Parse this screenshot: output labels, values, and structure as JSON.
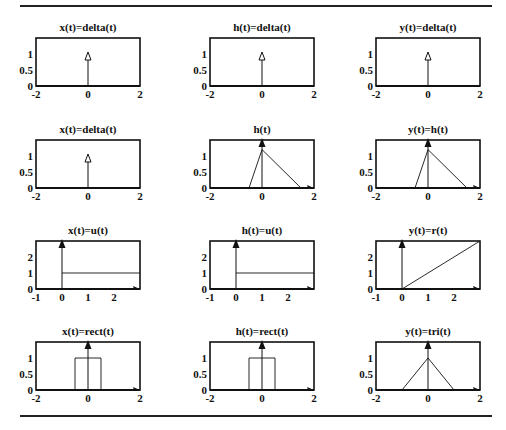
{
  "figure": {
    "rows": 4,
    "cols": 3,
    "panels": [
      {
        "title": "x(t)=delta(t)",
        "xlim": [
          -2,
          2
        ],
        "ylim": [
          0,
          1.5
        ],
        "xticks": [
          "-2",
          "0",
          "2"
        ],
        "yticks": [
          "0",
          "0.5",
          "1"
        ],
        "ytick_vals": [
          0,
          0.5,
          1
        ],
        "xtick_vals": [
          -2,
          0,
          2
        ],
        "kind": "impulse_open"
      },
      {
        "title": "h(t)=delta(t)",
        "xlim": [
          -2,
          2
        ],
        "ylim": [
          0,
          1.5
        ],
        "xticks": [
          "-2",
          "0",
          "2"
        ],
        "yticks": [
          "0",
          "0.5",
          "1"
        ],
        "ytick_vals": [
          0,
          0.5,
          1
        ],
        "xtick_vals": [
          -2,
          0,
          2
        ],
        "kind": "impulse_open"
      },
      {
        "title": "y(t)=delta(t)",
        "xlim": [
          -2,
          2
        ],
        "ylim": [
          0,
          1.5
        ],
        "xticks": [
          "-2",
          "0",
          "2"
        ],
        "yticks": [
          "0",
          "0.5",
          "1"
        ],
        "ytick_vals": [
          0,
          0.5,
          1
        ],
        "xtick_vals": [
          -2,
          0,
          2
        ],
        "kind": "impulse_open"
      },
      {
        "title": "x(t)=delta(t)",
        "xlim": [
          -2,
          2
        ],
        "ylim": [
          0,
          1.5
        ],
        "xticks": [
          "-2",
          "0",
          "2"
        ],
        "yticks": [
          "0",
          "0.5",
          "1"
        ],
        "ytick_vals": [
          0,
          0.5,
          1
        ],
        "xtick_vals": [
          -2,
          0,
          2
        ],
        "kind": "impulse_open"
      },
      {
        "title": "h(t)",
        "xlim": [
          -2,
          2
        ],
        "ylim": [
          0,
          1.5
        ],
        "xticks": [
          "-2",
          "0",
          "2"
        ],
        "yticks": [
          "0",
          "0.5",
          "1"
        ],
        "ytick_vals": [
          0,
          0.5,
          1
        ],
        "xtick_vals": [
          -2,
          0,
          2
        ],
        "kind": "curve",
        "points": [
          [
            -0.5,
            0
          ],
          [
            0,
            1.2
          ],
          [
            1.5,
            0
          ]
        ]
      },
      {
        "title": "y(t)=h(t)",
        "xlim": [
          -2,
          2
        ],
        "ylim": [
          0,
          1.5
        ],
        "xticks": [
          "-2",
          "0",
          "2"
        ],
        "yticks": [
          "0",
          "0.5",
          "1"
        ],
        "ytick_vals": [
          0,
          0.5,
          1
        ],
        "xtick_vals": [
          -2,
          0,
          2
        ],
        "kind": "curve",
        "points": [
          [
            -0.5,
            0
          ],
          [
            0,
            1.2
          ],
          [
            1.5,
            0
          ]
        ]
      },
      {
        "title": "x(t)=u(t)",
        "xlim": [
          -1,
          3
        ],
        "ylim": [
          0,
          3
        ],
        "xticks": [
          "-1",
          "0",
          "1",
          "2"
        ],
        "yticks": [
          "0",
          "1",
          "2"
        ],
        "ytick_vals": [
          0,
          1,
          2
        ],
        "xtick_vals": [
          -1,
          0,
          1,
          2
        ],
        "kind": "curve",
        "points": [
          [
            0,
            1
          ],
          [
            3,
            1
          ]
        ]
      },
      {
        "title": "h(t)=u(t)",
        "xlim": [
          -1,
          3
        ],
        "ylim": [
          0,
          3
        ],
        "xticks": [
          "-1",
          "0",
          "1",
          "2"
        ],
        "yticks": [
          "0",
          "1",
          "2"
        ],
        "ytick_vals": [
          0,
          1,
          2
        ],
        "xtick_vals": [
          -1,
          0,
          1,
          2
        ],
        "kind": "curve",
        "points": [
          [
            0,
            1
          ],
          [
            3,
            1
          ]
        ]
      },
      {
        "title": "y(t)=r(t)",
        "xlim": [
          -1,
          3
        ],
        "ylim": [
          0,
          3
        ],
        "xticks": [
          "-1",
          "0",
          "1",
          "2"
        ],
        "yticks": [
          "0",
          "1",
          "2"
        ],
        "ytick_vals": [
          0,
          1,
          2
        ],
        "xtick_vals": [
          -1,
          0,
          1,
          2
        ],
        "kind": "curve",
        "points": [
          [
            0,
            0
          ],
          [
            3,
            3
          ]
        ]
      },
      {
        "title": "x(t)=rect(t)",
        "xlim": [
          -2,
          2
        ],
        "ylim": [
          0,
          1.5
        ],
        "xticks": [
          "-2",
          "0",
          "2"
        ],
        "yticks": [
          "0",
          "0.5",
          "1"
        ],
        "ytick_vals": [
          0,
          0.5,
          1
        ],
        "xtick_vals": [
          -2,
          0,
          2
        ],
        "kind": "curve",
        "points": [
          [
            -0.5,
            0
          ],
          [
            -0.5,
            1
          ],
          [
            0.5,
            1
          ],
          [
            0.5,
            0
          ]
        ]
      },
      {
        "title": "h(t)=rect(t)",
        "xlim": [
          -2,
          2
        ],
        "ylim": [
          0,
          1.5
        ],
        "xticks": [
          "-2",
          "0",
          "2"
        ],
        "yticks": [
          "0",
          "0.5",
          "1"
        ],
        "ytick_vals": [
          0,
          0.5,
          1
        ],
        "xtick_vals": [
          -2,
          0,
          2
        ],
        "kind": "curve",
        "points": [
          [
            -0.5,
            0
          ],
          [
            -0.5,
            1
          ],
          [
            0.5,
            1
          ],
          [
            0.5,
            0
          ]
        ]
      },
      {
        "title": "y(t)=tri(t)",
        "xlim": [
          -2,
          2
        ],
        "ylim": [
          0,
          1.5
        ],
        "xticks": [
          "-2",
          "0",
          "2"
        ],
        "yticks": [
          "0",
          "0.5",
          "1"
        ],
        "ytick_vals": [
          0,
          0.5,
          1
        ],
        "xtick_vals": [
          -2,
          0,
          2
        ],
        "kind": "curve",
        "points": [
          [
            -1,
            0
          ],
          [
            0,
            1
          ],
          [
            1,
            0
          ]
        ]
      }
    ]
  },
  "colors": {
    "ink": "#111111",
    "rule": "#222222",
    "background": "#ffffff"
  }
}
